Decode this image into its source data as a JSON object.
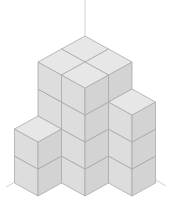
{
  "diagram": {
    "type": "isometric-cube-stack",
    "projection": {
      "origin": [
        85,
        144
      ],
      "unit_dx": 23.5,
      "unit_dy": 13,
      "unit_dz": 27
    },
    "colors": {
      "top": "#e7e7e7",
      "left": "#dddddd",
      "right": "#d3d3d3",
      "edge": "#a9a9a9",
      "axis": "#d2d2d2",
      "background": "#ffffff"
    },
    "columns": [
      {
        "x": 0,
        "y": 0,
        "height": 4
      },
      {
        "x": 1,
        "y": 0,
        "height": 4
      },
      {
        "x": 0,
        "y": 1,
        "height": 4
      },
      {
        "x": 1,
        "y": 1,
        "height": 4
      },
      {
        "x": 2,
        "y": 0,
        "height": 3
      },
      {
        "x": 0,
        "y": 2,
        "height": 2
      }
    ],
    "total_cubes": 21,
    "axes": [
      {
        "name": "vertical-axis",
        "from": [
          85,
          0
        ],
        "to": [
          85,
          36
        ]
      },
      {
        "name": "left-ground-axis",
        "from": [
          15,
          182
        ],
        "to": [
          6,
          187
        ]
      },
      {
        "name": "right-ground-axis",
        "from": [
          156,
          180
        ],
        "to": [
          166,
          186
        ]
      }
    ]
  }
}
